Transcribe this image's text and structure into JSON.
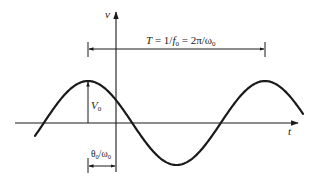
{
  "diagram": {
    "type": "sinusoid-annotation",
    "axes": {
      "vertical_label": "v",
      "horizontal_label": "t"
    },
    "annotations": {
      "period_label": "T = 1/f₀ = 2π/ω₀",
      "period_label_parts": {
        "T": "T",
        "eq1": " = 1/",
        "f": "f",
        "f_sub": "0",
        "eq2": " = 2π/ω",
        "w_sub": "0"
      },
      "amplitude_label": "V₀",
      "amplitude_parts": {
        "V": "V",
        "sub": "0"
      },
      "phase_label": "θ₀/ω₀",
      "phase_parts": {
        "theta": "θ",
        "sub1": "0",
        "slash": "/ω",
        "sub2": "0"
      }
    },
    "geometry": {
      "origin_x": 116,
      "axis_y": 123,
      "amplitude_px": 42,
      "period_px": 177,
      "peak_x": 88,
      "curve_x_start": 35,
      "curve_x_end": 303
    },
    "colors": {
      "stroke": "#1a1a1a",
      "background": "#ffffff"
    }
  }
}
